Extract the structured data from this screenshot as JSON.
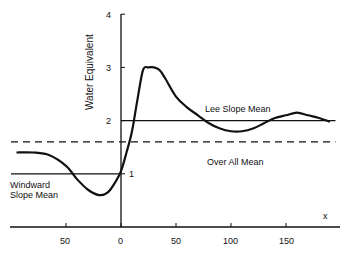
{
  "chart_data": {
    "type": "line",
    "title": "",
    "xlabel": "x",
    "ylabel": "Water Equivalent",
    "xlim": [
      -100,
      195
    ],
    "ylim": [
      0,
      4
    ],
    "grid": false,
    "x_ticks": [
      -50,
      0,
      50,
      100,
      150
    ],
    "x_tick_labels": [
      "50",
      "0",
      "50",
      "100",
      "150"
    ],
    "y_ticks": [
      1,
      2,
      3,
      4
    ],
    "y_tick_labels": [
      "1",
      "2",
      "3",
      "4"
    ],
    "series": [
      {
        "name": "Water Equivalent",
        "style": "solid",
        "x": [
          -95,
          -80,
          -65,
          -50,
          -40,
          -30,
          -20,
          -12,
          -5,
          0,
          5,
          10,
          15,
          20,
          25,
          30,
          35,
          40,
          50,
          60,
          70,
          80,
          90,
          100,
          110,
          120,
          130,
          140,
          150,
          160,
          170,
          180,
          190
        ],
        "y": [
          1.4,
          1.4,
          1.35,
          1.15,
          0.9,
          0.7,
          0.6,
          0.65,
          0.85,
          1.05,
          1.4,
          1.8,
          2.4,
          2.95,
          3.0,
          3.0,
          2.95,
          2.8,
          2.45,
          2.25,
          2.1,
          1.95,
          1.85,
          1.8,
          1.8,
          1.85,
          1.95,
          2.05,
          2.1,
          2.15,
          2.1,
          2.05,
          1.98
        ]
      },
      {
        "name": "Lee Slope Mean",
        "style": "solid",
        "x": [
          0,
          195
        ],
        "y": [
          2.0,
          2.0
        ]
      },
      {
        "name": "Over All Mean",
        "style": "dashed",
        "x": [
          -100,
          195
        ],
        "y": [
          1.6,
          1.6
        ]
      },
      {
        "name": "Windward Slope Mean",
        "style": "solid",
        "x": [
          -100,
          0
        ],
        "y": [
          1.0,
          1.0
        ]
      }
    ],
    "annotations": [
      {
        "text": "Lee Slope Mean",
        "x": 60,
        "y": 2.15
      },
      {
        "text": "Over All Mean",
        "x": 80,
        "y": 1.4
      },
      {
        "text": "Windward\nSlope Mean",
        "x": -100,
        "y": 0.85
      },
      {
        "text": "1",
        "x": 5,
        "y": 1.0
      },
      {
        "text": "x",
        "x": 185,
        "y": 0.2
      }
    ]
  },
  "labels": {
    "ylabel": "Water Equivalent",
    "xlabel": "x",
    "lee": "Lee Slope Mean",
    "overall": "Over All Mean",
    "windward_1": "Windward",
    "windward_2": "Slope Mean",
    "one_marker": "1",
    "y4": "4",
    "y3": "3",
    "y2": "2",
    "xm50": "50",
    "x0": "0",
    "x50": "50",
    "x100": "100",
    "x150": "150"
  }
}
